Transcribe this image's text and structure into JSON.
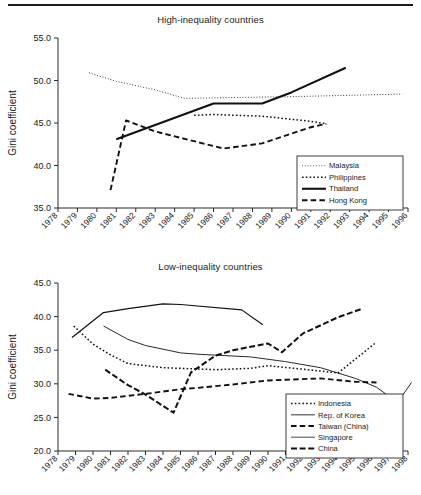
{
  "figure": {
    "has_top_rule": true,
    "background": "#ffffff",
    "ink": "#111111"
  },
  "panels": [
    {
      "id": "high",
      "title": "High-inequality countries"
    },
    {
      "id": "low",
      "title": "Low-inequality countries"
    }
  ],
  "chart_data": [
    {
      "type": "line",
      "title": "High-inequality countries",
      "xlabel": "",
      "ylabel": "Gini coefficient",
      "xlim": [
        1978,
        1996
      ],
      "ylim": [
        35.0,
        55.0
      ],
      "yticks": [
        "35.0",
        "40.0",
        "45.0",
        "50.0",
        "55.0"
      ],
      "xticks": [
        "1978",
        "1979",
        "1980",
        "1981",
        "1982",
        "1983",
        "1984",
        "1985",
        "1986",
        "1987",
        "1988",
        "1989",
        "1990",
        "1991",
        "1992",
        "1993",
        "1994",
        "1995",
        "1996"
      ],
      "grid": false,
      "legend_position": "bottom-right",
      "series": [
        {
          "name": "Malaysia",
          "style": "dotted-fine",
          "x": [
            1979.6,
            1981,
            1983,
            1984.5,
            1990,
            1995.7
          ],
          "y": [
            50.9,
            49.9,
            48.9,
            47.9,
            48.1,
            48.4
          ]
        },
        {
          "name": "Philippines",
          "style": "dotted-coarse",
          "x": [
            1985,
            1986,
            1988.5,
            1991,
            1991.8
          ],
          "y": [
            45.9,
            46.0,
            45.8,
            45.2,
            44.9
          ]
        },
        {
          "name": "Thailand",
          "style": "solid",
          "x": [
            1981,
            1986,
            1988.5,
            1990,
            1992.8
          ],
          "y": [
            43.1,
            47.3,
            47.3,
            48.6,
            51.5
          ]
        },
        {
          "name": "Hong Kong",
          "style": "dashed",
          "x": [
            1980.7,
            1981.5,
            1983,
            1986.5,
            1988.5,
            1991,
            1991.8
          ],
          "y": [
            37.1,
            45.3,
            44.0,
            42.0,
            42.6,
            44.5,
            44.9
          ]
        }
      ]
    },
    {
      "type": "line",
      "title": "Low-inequality countries",
      "xlabel": "",
      "ylabel": "Gini coefficient",
      "xlim": [
        1978,
        1998
      ],
      "ylim": [
        20.0,
        45.0
      ],
      "yticks": [
        "20.0",
        "25.0",
        "30.0",
        "35.0",
        "40.0",
        "45.0"
      ],
      "xticks": [
        "1978",
        "1979",
        "1980",
        "1981",
        "1982",
        "1983",
        "1984",
        "1985",
        "1986",
        "1987",
        "1988",
        "1989",
        "1990",
        "1991",
        "1992",
        "1993",
        "1994",
        "1995",
        "1996",
        "1997",
        "1998"
      ],
      "grid": false,
      "legend_position": "bottom-right",
      "series": [
        {
          "name": "Indonesia",
          "style": "dotted-coarse",
          "x": [
            1978.9,
            1980,
            1981,
            1982,
            1984,
            1985,
            1987,
            1989,
            1990,
            1993,
            1994,
            1996.2
          ],
          "y": [
            38.6,
            35.9,
            34.3,
            33.0,
            32.4,
            32.3,
            32.1,
            32.3,
            32.7,
            31.9,
            31.6,
            36.2
          ]
        },
        {
          "name": "Rep. of Korea",
          "style": "solid-grey",
          "x": [
            1978.8,
            1980.6,
            1982,
            1984,
            1985,
            1988.5,
            1989.7
          ],
          "y": [
            36.9,
            40.6,
            41.2,
            41.9,
            41.8,
            41.0,
            38.8
          ]
        },
        {
          "name": "Taiwan (China)",
          "style": "dashed",
          "x": [
            1978.6,
            1980,
            1981,
            1983,
            1985,
            1986,
            1988,
            1990,
            1991,
            1993,
            1995,
            1996.2
          ],
          "y": [
            28.5,
            27.8,
            27.9,
            28.5,
            29.2,
            29.4,
            29.9,
            30.5,
            30.6,
            30.8,
            30.3,
            30.2
          ]
        },
        {
          "name": "Singapore",
          "style": "solid-thin",
          "x": [
            1980.6,
            1982,
            1983,
            1985,
            1986,
            1989,
            1991,
            1993,
            1995,
            1996.2,
            1997.4,
            1998.2
          ],
          "y": [
            38.6,
            36.6,
            35.7,
            34.6,
            34.4,
            34.0,
            33.3,
            32.4,
            30.8,
            29.5,
            27.2,
            30.2
          ]
        },
        {
          "name": "China",
          "style": "dashed-heavy",
          "x": [
            1980.7,
            1982,
            1983,
            1984.6,
            1985.6,
            1987,
            1988,
            1990,
            1990.8,
            1992,
            1994,
            1995.4
          ],
          "y": [
            32.1,
            29.8,
            28.4,
            25.7,
            31.7,
            34.2,
            35.0,
            36.0,
            34.7,
            37.5,
            39.9,
            41.2
          ]
        }
      ]
    }
  ]
}
